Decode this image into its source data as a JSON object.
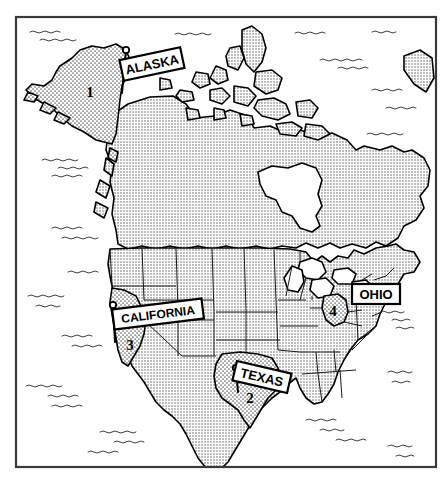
{
  "map": {
    "title": "North America political map",
    "frame": {
      "x": 16,
      "y": 17,
      "width": 420,
      "height": 450,
      "color": "#3a3a3a"
    },
    "background_color": "#ffffff",
    "land_fill_color": "#c9c9c9",
    "highlight_fill_color": "#efefef",
    "water_color": "#ffffff",
    "outline_color": "#000000"
  },
  "labels": [
    {
      "id": "alaska",
      "text": "ALASKA",
      "rotation": -12,
      "box_cx": 152,
      "box_cy": 64,
      "box_w": 62,
      "box_h": 21,
      "font_size": 13,
      "pin_x": 126,
      "pin_y": 50,
      "leader_to_x": 122,
      "leader_to_y": 93
    },
    {
      "id": "california",
      "text": "CALIFORNIA",
      "rotation": -7,
      "box_cx": 158,
      "box_cy": 314,
      "box_w": 90,
      "box_h": 20,
      "font_size": 12,
      "pin_x": 113,
      "pin_y": 305,
      "leader_to_x": 115,
      "leader_to_y": 342
    },
    {
      "id": "texas",
      "text": "TEXAS",
      "rotation": 13,
      "box_cx": 262,
      "box_cy": 377,
      "box_w": 56,
      "box_h": 20,
      "font_size": 13,
      "pin_x": 236,
      "pin_y": 368,
      "leader_to_x": 238,
      "leader_to_y": 392
    },
    {
      "id": "ohio",
      "text": "OHIO",
      "rotation": 0,
      "box_cx": 376,
      "box_cy": 294,
      "box_w": 48,
      "box_h": 20,
      "font_size": 13,
      "pin_x": 354,
      "pin_y": 294,
      "leader_to_x": 354,
      "leader_to_y": 294
    }
  ],
  "markers": [
    {
      "id": "marker-1",
      "number": "1",
      "x": 90,
      "y": 92,
      "region": "ALASKA"
    },
    {
      "id": "marker-2",
      "number": "2",
      "x": 250,
      "y": 398,
      "region": "TEXAS"
    },
    {
      "id": "marker-3",
      "number": "3",
      "x": 130,
      "y": 345,
      "region": "CALIFORNIA"
    },
    {
      "id": "marker-4",
      "number": "4",
      "x": 333,
      "y": 311,
      "region": "OHIO"
    }
  ],
  "legend_note": ""
}
